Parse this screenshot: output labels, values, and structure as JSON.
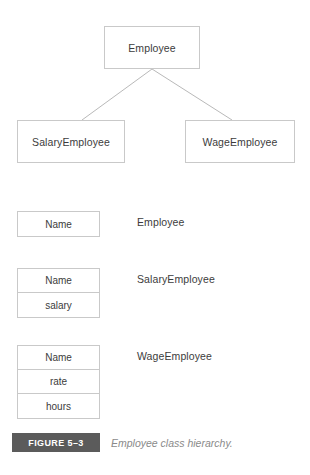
{
  "figure": {
    "tag": "FIGURE 5–3",
    "caption": "Employee class hierarchy."
  },
  "hierarchy": {
    "superclass": {
      "name": "Employee"
    },
    "subclasses": [
      {
        "name": "SalaryEmployee"
      },
      {
        "name": "WageEmployee"
      }
    ]
  },
  "attribute_tables": [
    {
      "class_label": "Employee",
      "rows": [
        {
          "field": "Name"
        }
      ]
    },
    {
      "class_label": "SalaryEmployee",
      "rows": [
        {
          "field": "Name"
        },
        {
          "field": "salary"
        }
      ]
    },
    {
      "class_label": "WageEmployee",
      "rows": [
        {
          "field": "Name"
        },
        {
          "field": "rate"
        },
        {
          "field": "hours"
        }
      ]
    }
  ],
  "style": {
    "box_border_color": "#c9c9c9",
    "text_color": "#3c3c3c",
    "caption_bar_color": "#5b5b5b",
    "caption_text_color": "#8a8a8a",
    "connector_color": "#b9b9b9",
    "background": "#ffffff"
  }
}
